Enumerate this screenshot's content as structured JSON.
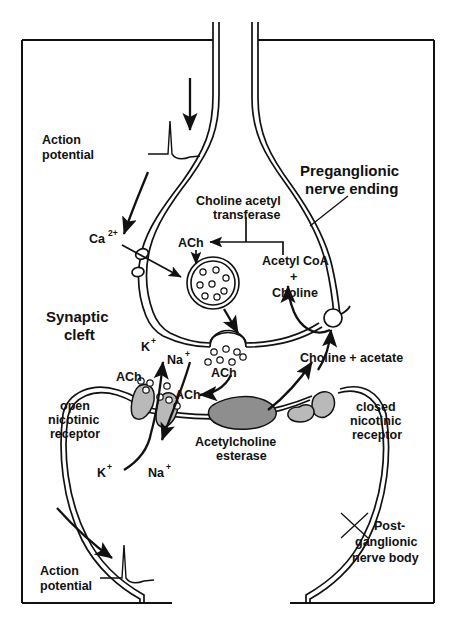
{
  "figure": {
    "domain": "Diagram",
    "background_color": "#ffffff",
    "ink_color": "#111111",
    "receptor_color": "#b9b9b9",
    "enzyme_color": "#8e8e8e"
  },
  "labels": {
    "action_potential_top": "Action\npotential",
    "action_potential_top_line1": "Action",
    "action_potential_top_line2": "potential",
    "preganglionic_line1": "Preganglionic",
    "preganglionic_line2": "nerve ending",
    "choline_acetyl_line1": "Choline acetyl",
    "choline_acetyl_line2": "transferase",
    "calcium": "Ca",
    "calcium_sup": "2+",
    "ach_vesicle": "ACh",
    "acetyl_coa": "Acetyl CoA",
    "plus": "+",
    "choline": "Choline",
    "synaptic_line1": "Synaptic",
    "synaptic_line2": "cleft",
    "ach_cleft": "ACh",
    "potassium_top": "K",
    "potassium_top_sup": "+",
    "sodium_top": "Na",
    "sodium_top_sup": "+",
    "potassium_bottom": "K",
    "potassium_bottom_sup": "+",
    "sodium_bottom": "Na",
    "sodium_bottom_sup": "+",
    "ach_receptor_left": "ACh",
    "ach_receptor_right": "ACh",
    "open_receptor_line1": "open",
    "open_receptor_line2": "nicotinic",
    "open_receptor_line3": "receptor",
    "closed_receptor_line1": "closed",
    "closed_receptor_line2": "nicotinic",
    "closed_receptor_line3": "receptor",
    "ache_line1": "Acetylcholine",
    "ache_line2": "esterase",
    "choline_acetate": "Choline + acetate",
    "postganglionic_line1": "Post-",
    "postganglionic_line2": "ganglionic",
    "postganglionic_line3": "nerve body",
    "action_potential_bottom_line1": "Action",
    "action_potential_bottom_line2": "potential"
  },
  "elements": {
    "presynaptic_terminal": "preganglionic-nerve-ending",
    "postsynaptic_cell": "postganglionic-nerve-body",
    "vesicle": "synaptic-vesicle",
    "fused_vesicle": "fusing-vesicle",
    "calcium_channel": "calcium-channel",
    "choline_transporter": "choline-transporter",
    "enzyme": "acetylcholinesterase",
    "open_receptor": "open-nicotinic-receptor",
    "closed_receptor": "closed-nicotinic-receptor"
  }
}
